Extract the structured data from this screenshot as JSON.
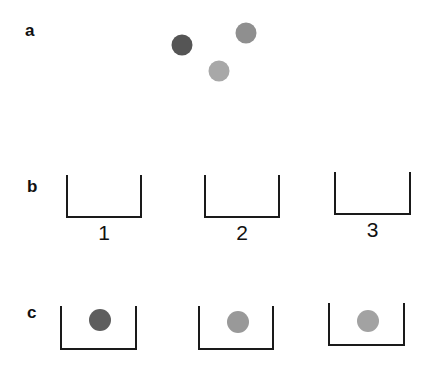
{
  "panels": {
    "a": {
      "label": "a",
      "balls": [
        {
          "name": "dark-ball",
          "cx": 182,
          "cy": 45,
          "r": 10.5,
          "color": "#555555"
        },
        {
          "name": "medium-ball",
          "cx": 246,
          "cy": 33,
          "r": 10.5,
          "color": "#8f8f8f"
        },
        {
          "name": "light-ball",
          "cx": 219,
          "cy": 71,
          "r": 10.5,
          "color": "#a8a8a8"
        }
      ]
    },
    "b": {
      "label": "b",
      "bins": [
        {
          "number": "1",
          "left": 67,
          "right": 141,
          "top": 175,
          "bottom": 217,
          "label_y": 240
        },
        {
          "number": "2",
          "left": 205,
          "right": 279,
          "top": 175,
          "bottom": 217,
          "label_y": 240
        },
        {
          "number": "3",
          "left": 335,
          "right": 410,
          "top": 172,
          "bottom": 214,
          "label_y": 237
        }
      ]
    },
    "c": {
      "label": "c",
      "bins": [
        {
          "left": 61,
          "right": 136,
          "top": 306,
          "bottom": 349,
          "ball": {
            "cx": 100,
            "cy": 320,
            "r": 11,
            "color": "#5e5e5e"
          }
        },
        {
          "left": 199,
          "right": 273,
          "top": 306,
          "bottom": 349,
          "ball": {
            "cx": 238,
            "cy": 322,
            "r": 11,
            "color": "#999999"
          }
        },
        {
          "left": 329,
          "right": 404,
          "top": 303,
          "bottom": 345,
          "ball": {
            "cx": 368,
            "cy": 321,
            "r": 11,
            "color": "#a2a2a2"
          }
        }
      ]
    }
  }
}
